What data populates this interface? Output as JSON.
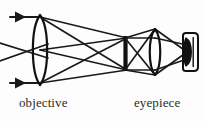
{
  "figure": {
    "kind": "optical-ray-diagram",
    "background_color": "#fdfdfd",
    "ink_color": "#1a1a1a",
    "label_color": "#2b2b2b",
    "width": 205,
    "height": 121
  },
  "labels": {
    "objective": "objective",
    "eyepiece": "eyepiece"
  },
  "components": [
    {
      "name": "objective-lens",
      "type": "biconvex-lens",
      "center_x": 40,
      "center_y": 50,
      "half_width": 9,
      "half_height": 35
    },
    {
      "name": "field-stop",
      "type": "vertical-bar",
      "x": 125,
      "y_top": 36,
      "y_bottom": 71,
      "thickness": 4
    },
    {
      "name": "eyepiece-lens",
      "type": "biconvex-lens",
      "center_x": 155,
      "center_y": 52,
      "half_width": 7,
      "half_height": 23
    },
    {
      "name": "eye",
      "type": "eye-box",
      "x": 186,
      "y_top": 34,
      "y_bottom": 72,
      "width": 12
    }
  ],
  "rays": {
    "incoming_count": 4,
    "arrowheads": 2,
    "description": "Two parallel ray bundles enter from the left, cross at the objective, converge to an intermediate image at the field stop, then pass through the eyepiece to the eye."
  }
}
